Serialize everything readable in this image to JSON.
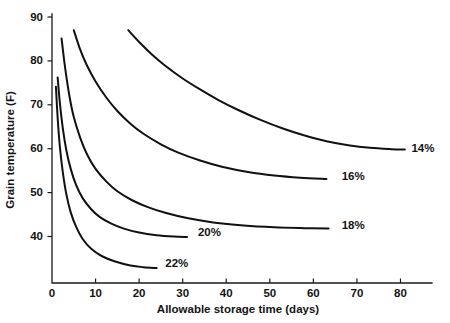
{
  "chart_data": {
    "type": "line",
    "title": "",
    "xlabel": "Allowable storage time (days)",
    "ylabel": "Grain temperature (F)",
    "xlim": [
      0,
      88
    ],
    "ylim": [
      28.8,
      90
    ],
    "xticks": [
      0,
      10,
      20,
      30,
      40,
      50,
      60,
      70,
      80
    ],
    "yticks": [
      40,
      50,
      60,
      70,
      80,
      90
    ],
    "xticklabels": [
      "0",
      "10",
      "20",
      "30",
      "40",
      "50",
      "60",
      "70",
      "80"
    ],
    "yticklabels": [
      "40",
      "50",
      "60",
      "70",
      "80",
      "90"
    ],
    "grid": false,
    "legend_position": "inline-end-of-curve",
    "series": [
      {
        "name": "14%",
        "label": "14%",
        "label_x": 82.5,
        "label_y": 60.0,
        "points": [
          {
            "x": 17.5,
            "y": 87.0
          },
          {
            "x": 20.0,
            "y": 84.3
          },
          {
            "x": 23.0,
            "y": 81.4
          },
          {
            "x": 26.0,
            "y": 78.9
          },
          {
            "x": 30.0,
            "y": 76.0
          },
          {
            "x": 34.0,
            "y": 73.5
          },
          {
            "x": 38.0,
            "y": 71.2
          },
          {
            "x": 43.0,
            "y": 68.7
          },
          {
            "x": 48.0,
            "y": 66.5
          },
          {
            "x": 53.0,
            "y": 64.6
          },
          {
            "x": 58.0,
            "y": 63.0
          },
          {
            "x": 63.0,
            "y": 61.7
          },
          {
            "x": 68.0,
            "y": 60.8
          },
          {
            "x": 73.0,
            "y": 60.2
          },
          {
            "x": 78.0,
            "y": 59.9
          },
          {
            "x": 81.0,
            "y": 59.8
          }
        ]
      },
      {
        "name": "16%",
        "label": "16%",
        "label_x": 66.5,
        "label_y": 53.6,
        "points": [
          {
            "x": 5.0,
            "y": 87.0
          },
          {
            "x": 6.5,
            "y": 82.5
          },
          {
            "x": 8.0,
            "y": 79.0
          },
          {
            "x": 10.0,
            "y": 75.3
          },
          {
            "x": 12.5,
            "y": 71.6
          },
          {
            "x": 15.0,
            "y": 68.6
          },
          {
            "x": 18.0,
            "y": 65.7
          },
          {
            "x": 21.0,
            "y": 63.4
          },
          {
            "x": 25.0,
            "y": 61.0
          },
          {
            "x": 29.0,
            "y": 59.1
          },
          {
            "x": 34.0,
            "y": 57.3
          },
          {
            "x": 39.0,
            "y": 55.9
          },
          {
            "x": 45.0,
            "y": 54.7
          },
          {
            "x": 51.0,
            "y": 53.9
          },
          {
            "x": 57.0,
            "y": 53.4
          },
          {
            "x": 63.0,
            "y": 53.1
          }
        ]
      },
      {
        "name": "18%",
        "label": "18%",
        "label_x": 66.5,
        "label_y": 42.5,
        "points": [
          {
            "x": 2.2,
            "y": 85.1
          },
          {
            "x": 3.0,
            "y": 78.5
          },
          {
            "x": 4.0,
            "y": 72.0
          },
          {
            "x": 5.0,
            "y": 67.2
          },
          {
            "x": 6.5,
            "y": 62.4
          },
          {
            "x": 8.0,
            "y": 58.8
          },
          {
            "x": 10.0,
            "y": 55.4
          },
          {
            "x": 12.5,
            "y": 52.5
          },
          {
            "x": 15.0,
            "y": 50.3
          },
          {
            "x": 18.5,
            "y": 48.2
          },
          {
            "x": 22.0,
            "y": 46.7
          },
          {
            "x": 26.0,
            "y": 45.4
          },
          {
            "x": 31.0,
            "y": 44.2
          },
          {
            "x": 37.0,
            "y": 43.2
          },
          {
            "x": 44.0,
            "y": 42.5
          },
          {
            "x": 51.0,
            "y": 42.1
          },
          {
            "x": 58.0,
            "y": 41.9
          },
          {
            "x": 63.5,
            "y": 41.8
          }
        ]
      },
      {
        "name": "20%",
        "label": "20%",
        "label_x": 33.5,
        "label_y": 40.8,
        "points": [
          {
            "x": 1.3,
            "y": 76.2
          },
          {
            "x": 1.8,
            "y": 70.5
          },
          {
            "x": 2.5,
            "y": 64.5
          },
          {
            "x": 3.3,
            "y": 59.6
          },
          {
            "x": 4.3,
            "y": 55.4
          },
          {
            "x": 5.5,
            "y": 51.8
          },
          {
            "x": 7.0,
            "y": 48.8
          },
          {
            "x": 9.0,
            "y": 46.2
          },
          {
            "x": 11.0,
            "y": 44.4
          },
          {
            "x": 13.5,
            "y": 43.0
          },
          {
            "x": 16.5,
            "y": 41.8
          },
          {
            "x": 20.0,
            "y": 40.9
          },
          {
            "x": 24.0,
            "y": 40.3
          },
          {
            "x": 28.0,
            "y": 40.0
          },
          {
            "x": 31.0,
            "y": 39.9
          }
        ]
      },
      {
        "name": "22%",
        "label": "22%",
        "label_x": 26.0,
        "label_y": 33.8,
        "points": [
          {
            "x": 0.9,
            "y": 74.1
          },
          {
            "x": 1.3,
            "y": 67.0
          },
          {
            "x": 1.8,
            "y": 60.5
          },
          {
            "x": 2.5,
            "y": 54.5
          },
          {
            "x": 3.3,
            "y": 49.6
          },
          {
            "x": 4.3,
            "y": 45.5
          },
          {
            "x": 5.5,
            "y": 42.3
          },
          {
            "x": 7.0,
            "y": 39.5
          },
          {
            "x": 9.0,
            "y": 37.2
          },
          {
            "x": 11.5,
            "y": 35.5
          },
          {
            "x": 14.5,
            "y": 34.3
          },
          {
            "x": 18.0,
            "y": 33.4
          },
          {
            "x": 21.0,
            "y": 33.0
          },
          {
            "x": 24.0,
            "y": 32.8
          }
        ]
      }
    ],
    "colors": {
      "curve": "#111111",
      "axis": "#1a1a1a",
      "text": "#141414",
      "background": "#ffffff"
    }
  }
}
